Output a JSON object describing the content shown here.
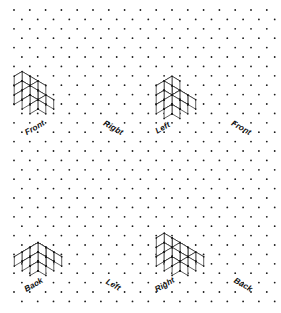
{
  "page": {
    "background_color": "#ffffff",
    "ink_color": "#1a1a1a",
    "width": 281,
    "height": 313
  },
  "grid": {
    "name": "isometric-dot-grid",
    "dot_color": "#1a1a1a",
    "dot_radius": 0.9,
    "col_spacing": 15.8,
    "row_spacing": 9.4,
    "row_offset": 7.9,
    "origin_x": 14,
    "origin_y": 10,
    "cols": 18,
    "rows": 32
  },
  "cube": {
    "half_width": 7.9,
    "half_depth_rise": 4.7,
    "vertical_edge": 9.4,
    "face_fill": "#ffffff",
    "edge_color": "#1a1a1a",
    "edge_width": 0.7
  },
  "panels": [
    {
      "id": "panel-top-left",
      "name": "cube-figure-top-left",
      "position": "top-left",
      "origin": {
        "x": 30,
        "y": 95
      },
      "cubes": [
        [
          0,
          0,
          0
        ],
        [
          1,
          0,
          0
        ],
        [
          0,
          1,
          0
        ],
        [
          1,
          1,
          0
        ],
        [
          2,
          0,
          0
        ],
        [
          2,
          1,
          0
        ],
        [
          0,
          0,
          1
        ],
        [
          0,
          1,
          1
        ],
        [
          1,
          1,
          1
        ],
        [
          1,
          0,
          1
        ],
        [
          0,
          1,
          2
        ]
      ],
      "labels": [
        {
          "text": "Front",
          "x": 36,
          "y": 130,
          "rotation": -30,
          "name": "label-front"
        },
        {
          "text": "Right",
          "x": 112,
          "y": 130,
          "rotation": 30,
          "name": "label-right"
        }
      ]
    },
    {
      "id": "panel-top-right",
      "name": "cube-figure-top-right",
      "position": "top-right",
      "origin": {
        "x": 172,
        "y": 95
      },
      "cubes": [
        [
          0,
          0,
          0
        ],
        [
          1,
          0,
          0
        ],
        [
          2,
          0,
          0
        ],
        [
          2,
          1,
          0
        ],
        [
          2,
          2,
          0
        ],
        [
          1,
          1,
          0
        ],
        [
          1,
          2,
          0
        ],
        [
          0,
          0,
          1
        ],
        [
          2,
          1,
          1
        ],
        [
          2,
          2,
          1
        ],
        [
          1,
          2,
          1
        ],
        [
          1,
          2,
          2
        ]
      ],
      "labels": [
        {
          "text": "Left",
          "x": 164,
          "y": 130,
          "rotation": -30,
          "name": "label-left"
        },
        {
          "text": "Front",
          "x": 240,
          "y": 130,
          "rotation": 30,
          "name": "label-front"
        }
      ]
    },
    {
      "id": "panel-bottom-left",
      "name": "cube-figure-bottom-left",
      "position": "bottom-left",
      "origin": {
        "x": 38,
        "y": 252
      },
      "cubes": [
        [
          0,
          0,
          0
        ],
        [
          1,
          0,
          0
        ],
        [
          2,
          0,
          0
        ],
        [
          0,
          1,
          0
        ],
        [
          1,
          1,
          0
        ],
        [
          2,
          1,
          0
        ],
        [
          0,
          2,
          0
        ],
        [
          1,
          2,
          0
        ],
        [
          2,
          2,
          0
        ],
        [
          1,
          1,
          1
        ],
        [
          2,
          1,
          1
        ],
        [
          1,
          2,
          1
        ],
        [
          2,
          2,
          1
        ],
        [
          2,
          2,
          2
        ]
      ],
      "labels": [
        {
          "text": "Back",
          "x": 35,
          "y": 287,
          "rotation": -30,
          "name": "label-back"
        },
        {
          "text": "Left",
          "x": 112,
          "y": 287,
          "rotation": 30,
          "name": "label-left"
        }
      ]
    },
    {
      "id": "panel-bottom-right",
      "name": "cube-figure-bottom-right",
      "position": "bottom-right",
      "origin": {
        "x": 180,
        "y": 252
      },
      "cubes": [
        [
          0,
          0,
          0
        ],
        [
          1,
          0,
          0
        ],
        [
          2,
          0,
          0
        ],
        [
          0,
          1,
          0
        ],
        [
          1,
          1,
          0
        ],
        [
          2,
          1,
          0
        ],
        [
          0,
          2,
          0
        ],
        [
          1,
          2,
          0
        ],
        [
          2,
          2,
          0
        ],
        [
          0,
          1,
          1
        ],
        [
          1,
          1,
          1
        ],
        [
          0,
          2,
          1
        ],
        [
          1,
          2,
          1
        ],
        [
          0,
          2,
          2
        ]
      ],
      "labels": [
        {
          "text": "Right",
          "x": 166,
          "y": 287,
          "rotation": -30,
          "name": "label-right"
        },
        {
          "text": "Back",
          "x": 242,
          "y": 287,
          "rotation": 30,
          "name": "label-back"
        }
      ]
    }
  ],
  "label_style": {
    "font_size": 8.2,
    "bold": true,
    "italic": true,
    "color": "#111111"
  }
}
